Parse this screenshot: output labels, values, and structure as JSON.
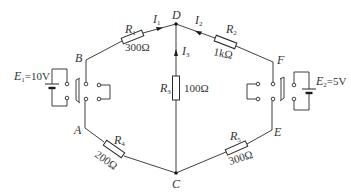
{
  "figure": {
    "type": "circuit-diagram",
    "nodes": {
      "A": {
        "label": "A"
      },
      "B": {
        "label": "B"
      },
      "C": {
        "label": "C"
      },
      "D": {
        "label": "D"
      },
      "E": {
        "label": "E"
      },
      "F": {
        "label": "F"
      }
    },
    "resistors": [
      {
        "id": "R1",
        "symbol": "R",
        "sub": "1",
        "value": "300Ω",
        "between": "B-D"
      },
      {
        "id": "R2",
        "symbol": "R",
        "sub": "2",
        "value": "1kΩ",
        "between": "D-F"
      },
      {
        "id": "R3",
        "symbol": "R",
        "sub": "3",
        "value": "100Ω",
        "between": "D-C"
      },
      {
        "id": "R4",
        "symbol": "R",
        "sub": "4",
        "value": "200Ω",
        "between": "A-C"
      },
      {
        "id": "R5",
        "symbol": "R",
        "sub": "5",
        "value": "300Ω",
        "between": "C-E"
      }
    ],
    "currents": [
      {
        "id": "I1",
        "symbol": "I",
        "sub": "1",
        "direction": "B→D"
      },
      {
        "id": "I2",
        "symbol": "I",
        "sub": "2",
        "direction": "F→D"
      },
      {
        "id": "I3",
        "symbol": "I",
        "sub": "3",
        "direction": "C→D"
      }
    ],
    "sources": [
      {
        "id": "E1",
        "symbol": "E",
        "sub": "1",
        "value": "=10V",
        "side": "left"
      },
      {
        "id": "E2",
        "symbol": "E",
        "sub": "2",
        "value": "=5V",
        "side": "right"
      }
    ],
    "switches": [
      {
        "id": "S-left",
        "position": "between A and B"
      },
      {
        "id": "S-right",
        "position": "between E and F"
      }
    ]
  }
}
